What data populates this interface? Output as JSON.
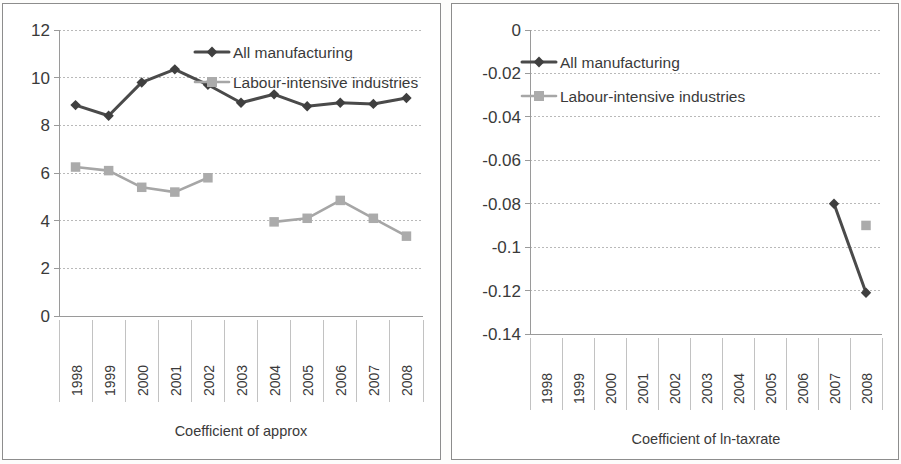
{
  "figure": {
    "background_color": "#ffffff",
    "dark_series_color": "#4a4a4a",
    "gray_series_color": "#a6a6a6"
  },
  "legend": {
    "all_manufacturing": "All manufacturing",
    "labour_intensive": "Labour-intensive industries"
  },
  "chart_data": [
    {
      "type": "line",
      "title": "",
      "xlabel": "Coefficient of approx",
      "ylabel": "",
      "ylim": [
        0,
        12
      ],
      "yticks": [
        0,
        2,
        4,
        6,
        8,
        10,
        12
      ],
      "ytick_labels": [
        "0",
        "2",
        "4",
        "6",
        "8",
        "10",
        "12"
      ],
      "categories": [
        "1998",
        "1999",
        "2000",
        "2001",
        "2002",
        "2003",
        "2004",
        "2005",
        "2006",
        "2007",
        "2008"
      ],
      "grid": true,
      "legend_position": "top-center",
      "series": [
        {
          "name": "All manufacturing",
          "marker": "diamond",
          "color": "#4a4a4a",
          "values": [
            8.85,
            8.4,
            9.8,
            10.35,
            9.7,
            8.95,
            9.3,
            8.8,
            8.95,
            8.9,
            9.15
          ]
        },
        {
          "name": "Labour-intensive industries",
          "marker": "square",
          "color": "#a6a6a6",
          "values": [
            6.25,
            6.1,
            5.4,
            5.2,
            5.8,
            null,
            3.95,
            4.1,
            4.85,
            4.1,
            3.35
          ]
        }
      ]
    },
    {
      "type": "line",
      "title": "",
      "xlabel": "Coefficient of ln-taxrate",
      "ylabel": "",
      "ylim": [
        -0.14,
        0
      ],
      "yticks": [
        0,
        -0.02,
        -0.04,
        -0.06,
        -0.08,
        -0.1,
        -0.12,
        -0.14
      ],
      "ytick_labels": [
        "0",
        "-0.02",
        "-0.04",
        "-0.06",
        "-0.08",
        "-0.1",
        "-0.12",
        "-0.14"
      ],
      "categories": [
        "1998",
        "1999",
        "2000",
        "2001",
        "2002",
        "2003",
        "2004",
        "2005",
        "2006",
        "2007",
        "2008"
      ],
      "grid": true,
      "legend_position": "top-left",
      "series": [
        {
          "name": "All manufacturing",
          "marker": "diamond",
          "color": "#4a4a4a",
          "values": [
            null,
            null,
            null,
            null,
            null,
            null,
            null,
            null,
            null,
            -0.08,
            -0.121
          ]
        },
        {
          "name": "Labour-intensive industries",
          "marker": "square",
          "color": "#a6a6a6",
          "values": [
            null,
            null,
            null,
            null,
            null,
            null,
            null,
            null,
            null,
            null,
            -0.09
          ]
        }
      ]
    }
  ]
}
